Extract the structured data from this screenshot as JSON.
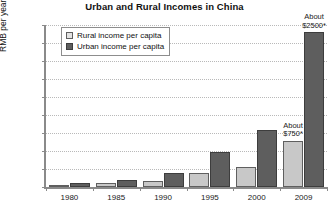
{
  "chart_data": {
    "type": "bar",
    "title": "Urban and Rural Incomes in China",
    "xlabel": "",
    "ylabel": "RMB per year",
    "categories": [
      "1980",
      "1985",
      "1990",
      "1995",
      "2000",
      "2009"
    ],
    "ylim": [
      0,
      18000
    ],
    "yticks": [
      0,
      2000,
      4000,
      6000,
      8000,
      10000,
      12000,
      14000,
      16000,
      18000
    ],
    "ytick_labels": [
      "0",
      "2000",
      "4000",
      "6000",
      "8000",
      "10000",
      "12000",
      "14000",
      "16000",
      "18000"
    ],
    "grid": true,
    "legend_position": "upper-left-inside",
    "series": [
      {
        "name": "Rural income per capita",
        "color": "#c8c8c8",
        "values": [
          190,
          400,
          690,
          1580,
          2250,
          5150
        ]
      },
      {
        "name": "Urban income per capita",
        "color": "#5e5e5e",
        "values": [
          480,
          740,
          1520,
          3900,
          6300,
          17200
        ]
      }
    ],
    "annotations": [
      {
        "name": "urban-2009-annotation",
        "line1": "About",
        "line2": "$2500*",
        "category": "2009",
        "series": "Urban income per capita"
      },
      {
        "name": "rural-2009-annotation",
        "line1": "About",
        "line2": "$750*",
        "category": "2009",
        "series": "Rural income per capita"
      }
    ]
  }
}
